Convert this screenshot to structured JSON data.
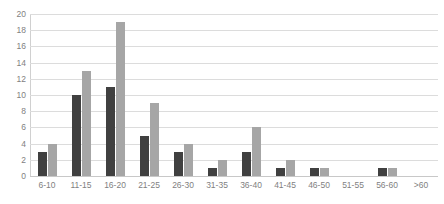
{
  "chart_data": {
    "type": "bar",
    "title": "",
    "subtitle": "",
    "xlabel": "",
    "ylabel": "",
    "ylim": [
      0,
      20
    ],
    "yticks": [
      0,
      2,
      4,
      6,
      8,
      10,
      12,
      14,
      16,
      18,
      20
    ],
    "grid": true,
    "legend": "none",
    "orientation": "vertical",
    "grouping": "grouped",
    "categories": [
      "6-10",
      "11-15",
      "16-20",
      "21-25",
      "26-30",
      "31-35",
      "36-40",
      "41-45",
      "46-50",
      "51-55",
      "56-60",
      ">60"
    ],
    "series": [
      {
        "name": "series-1",
        "color": "#404040",
        "values": [
          3,
          10,
          11,
          5,
          3,
          1,
          3,
          1,
          1,
          0,
          1,
          0
        ]
      },
      {
        "name": "series-2",
        "color": "#a6a6a6",
        "values": [
          4,
          13,
          19,
          9,
          4,
          2,
          6,
          2,
          1,
          0,
          1,
          0
        ]
      }
    ]
  },
  "style": {
    "gridline_color": "#dcdcdc",
    "axis_color": "#d0d0d0",
    "tick_label_color": "#7f7f7f",
    "background": "#ffffff"
  }
}
